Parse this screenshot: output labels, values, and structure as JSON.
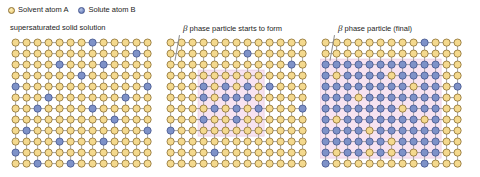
{
  "legend": {
    "items": [
      {
        "icon": "solvent-atom-circle",
        "label": "Solvent atom A",
        "color": "#f4d98e"
      },
      {
        "icon": "solute-atom-circle",
        "label": "Solute atom B",
        "color": "#7e92c8"
      }
    ]
  },
  "colors": {
    "solvent_fill": "#f4d98e",
    "solvent_stroke": "#8a6d2f",
    "solute_fill": "#7e92c8",
    "solute_stroke": "#41538c",
    "bond": "#9a9a9a",
    "beta_region": "#f7e3f1",
    "beta_region_stroke": "#e6c9de",
    "background": "#ffffff",
    "text": "#1c1c1c"
  },
  "lattice": {
    "cols": 13,
    "rows": 12,
    "spacing": 11,
    "atom_radius": 3.6
  },
  "panels": [
    {
      "id": "supersaturated",
      "title": "supersaturated solid solution",
      "title_plain": "supersaturated solid solution",
      "has_beta_label": false,
      "beta_region": null,
      "solute_sites": [
        [
          7,
          0
        ],
        [
          4,
          2
        ],
        [
          8,
          2
        ],
        [
          0,
          4
        ],
        [
          12,
          4
        ],
        [
          3,
          5
        ],
        [
          1,
          8
        ],
        [
          8,
          9
        ],
        [
          2,
          6
        ],
        [
          11,
          1
        ],
        [
          5,
          11
        ],
        [
          9,
          7
        ],
        [
          6,
          3
        ],
        [
          0,
          10
        ],
        [
          12,
          8
        ],
        [
          4,
          9
        ],
        [
          10,
          5
        ],
        [
          2,
          11
        ],
        [
          7,
          6
        ]
      ]
    },
    {
      "id": "nucleating",
      "title": "β phase particle starts to form",
      "title_beta": "β",
      "title_rest": " phase particle starts to form",
      "has_beta_label": true,
      "beta_region": {
        "col_start": 3,
        "col_end": 8,
        "row_start": 3,
        "row_end": 8
      },
      "solute_sites": [
        [
          7,
          1
        ],
        [
          3,
          4
        ],
        [
          5,
          4
        ],
        [
          7,
          4
        ],
        [
          9,
          4
        ],
        [
          3,
          5
        ],
        [
          5,
          5
        ],
        [
          6,
          5
        ],
        [
          7,
          5
        ],
        [
          4,
          6
        ],
        [
          6,
          6
        ],
        [
          8,
          6
        ],
        [
          3,
          7
        ],
        [
          6,
          7
        ],
        [
          4,
          10
        ],
        [
          11,
          2
        ],
        [
          0,
          8
        ],
        [
          12,
          6
        ]
      ]
    },
    {
      "id": "final",
      "title": "β phase particle (final)",
      "title_beta": "β",
      "title_rest": " phase particle (final)",
      "has_beta_label": true,
      "beta_region": {
        "col_start": 0,
        "col_end": 10,
        "row_start": 2,
        "row_end": 10
      },
      "solute_sites": [
        [
          9,
          0
        ],
        [
          0,
          2
        ],
        [
          1,
          2
        ],
        [
          2,
          2
        ],
        [
          3,
          2
        ],
        [
          4,
          2
        ],
        [
          5,
          2
        ],
        [
          6,
          2
        ],
        [
          7,
          2
        ],
        [
          8,
          2
        ],
        [
          9,
          2
        ],
        [
          10,
          2
        ],
        [
          0,
          3
        ],
        [
          2,
          3
        ],
        [
          3,
          3
        ],
        [
          4,
          3
        ],
        [
          5,
          3
        ],
        [
          7,
          3
        ],
        [
          8,
          3
        ],
        [
          9,
          3
        ],
        [
          10,
          3
        ],
        [
          0,
          4
        ],
        [
          1,
          4
        ],
        [
          2,
          4
        ],
        [
          3,
          4
        ],
        [
          4,
          4
        ],
        [
          5,
          4
        ],
        [
          6,
          4
        ],
        [
          7,
          4
        ],
        [
          9,
          4
        ],
        [
          10,
          4
        ],
        [
          12,
          4
        ],
        [
          0,
          5
        ],
        [
          1,
          5
        ],
        [
          2,
          5
        ],
        [
          4,
          5
        ],
        [
          5,
          5
        ],
        [
          6,
          5
        ],
        [
          7,
          5
        ],
        [
          8,
          5
        ],
        [
          9,
          5
        ],
        [
          10,
          5
        ],
        [
          0,
          6
        ],
        [
          1,
          6
        ],
        [
          2,
          6
        ],
        [
          3,
          6
        ],
        [
          4,
          6
        ],
        [
          5,
          6
        ],
        [
          6,
          6
        ],
        [
          8,
          6
        ],
        [
          9,
          6
        ],
        [
          10,
          6
        ],
        [
          0,
          7
        ],
        [
          2,
          7
        ],
        [
          3,
          7
        ],
        [
          4,
          7
        ],
        [
          5,
          7
        ],
        [
          6,
          7
        ],
        [
          7,
          7
        ],
        [
          8,
          7
        ],
        [
          10,
          7
        ],
        [
          0,
          8
        ],
        [
          1,
          8
        ],
        [
          2,
          8
        ],
        [
          3,
          8
        ],
        [
          5,
          8
        ],
        [
          6,
          8
        ],
        [
          7,
          8
        ],
        [
          8,
          8
        ],
        [
          9,
          8
        ],
        [
          10,
          8
        ],
        [
          0,
          9
        ],
        [
          1,
          9
        ],
        [
          2,
          9
        ],
        [
          3,
          9
        ],
        [
          4,
          9
        ],
        [
          5,
          9
        ],
        [
          7,
          9
        ],
        [
          8,
          9
        ],
        [
          9,
          9
        ],
        [
          10,
          9
        ],
        [
          0,
          10
        ],
        [
          2,
          10
        ],
        [
          3,
          10
        ],
        [
          5,
          10
        ],
        [
          7,
          10
        ],
        [
          9,
          10
        ],
        [
          10,
          10
        ],
        [
          0,
          11
        ],
        [
          9,
          11
        ]
      ]
    }
  ],
  "panel_positions": [
    {
      "left": 10,
      "title_left": 10
    },
    {
      "left": 165,
      "title_left": 183
    },
    {
      "left": 320,
      "title_left": 338
    }
  ]
}
